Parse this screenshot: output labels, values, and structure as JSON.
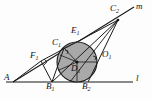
{
  "figure": {
    "kind": "geometry-diagram",
    "background_color": "#fdfdfd",
    "stroke_color": "#1a1a1a",
    "circle_fill_color": "#a9a9a9",
    "width": 152,
    "height": 100,
    "line_labels": [
      {
        "name": "line-l",
        "text": "l",
        "x": 136,
        "y": 74
      },
      {
        "name": "line-m",
        "text": "m",
        "x": 137,
        "y": 3
      }
    ],
    "point_labels": [
      {
        "name": "point-A",
        "base": "A",
        "sub": "",
        "x": 4,
        "y": 77
      },
      {
        "name": "point-B1",
        "base": "B",
        "sub": "1",
        "x": 46,
        "y": 86
      },
      {
        "name": "point-B2",
        "base": "B",
        "sub": "2",
        "x": 82,
        "y": 86
      },
      {
        "name": "point-C1",
        "base": "C",
        "sub": "1",
        "x": 54,
        "y": 42
      },
      {
        "name": "point-C2",
        "base": "C",
        "sub": "2",
        "x": 111,
        "y": 6
      },
      {
        "name": "point-D1",
        "base": "D",
        "sub": "1",
        "x": 73,
        "y": 69
      },
      {
        "name": "point-E1",
        "base": "E",
        "sub": "1",
        "x": 73,
        "y": 30
      },
      {
        "name": "point-F1",
        "base": "F",
        "sub": "1",
        "x": 31,
        "y": 56
      },
      {
        "name": "point-O1",
        "base": "O",
        "sub": "1",
        "x": 103,
        "y": 54
      }
    ],
    "points": {
      "A": {
        "x": 13,
        "y": 82
      },
      "B1": {
        "x": 52,
        "y": 82
      },
      "B2": {
        "x": 88,
        "y": 82
      },
      "C1": {
        "x": 64,
        "y": 48
      },
      "C2": {
        "x": 118,
        "y": 20
      },
      "D1": {
        "x": 70,
        "y": 82
      },
      "E1": {
        "x": 77,
        "y": 42
      },
      "F1": {
        "x": 41,
        "y": 61
      },
      "O1": {
        "x": 77,
        "y": 62
      }
    },
    "circle": {
      "cx": 77,
      "cy": 62,
      "r": 20
    },
    "right_angle_marks": [
      {
        "name": "right-angle-at-F1",
        "x": 44,
        "y": 62
      },
      {
        "name": "right-angle-at-C1",
        "x": 67,
        "y": 49
      },
      {
        "name": "right-angle-at-O1",
        "x": 91,
        "y": 52
      }
    ]
  }
}
